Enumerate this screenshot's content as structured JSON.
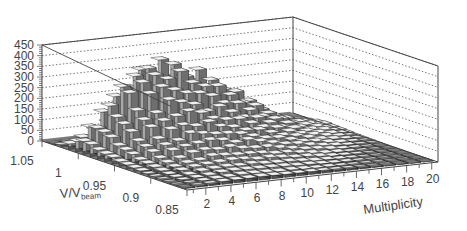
{
  "chart_data": {
    "type": "bar3d",
    "title": "",
    "xlabel": "Multiplicity",
    "ylabel": "V/V_beam",
    "ylabel_main": "V/V",
    "ylabel_sub": "beam",
    "zlabel": "",
    "x_range": [
      1,
      20
    ],
    "y_range": [
      0.85,
      1.05
    ],
    "z_range": [
      0,
      450
    ],
    "x_ticks": [
      2,
      4,
      6,
      8,
      10,
      12,
      14,
      16,
      18,
      20
    ],
    "y_ticks": [
      1.05,
      1,
      0.95,
      0.9,
      0.85
    ],
    "z_ticks": [
      0,
      50,
      100,
      150,
      200,
      250,
      300,
      350,
      400,
      450
    ],
    "grid": "dotted on back walls",
    "legend": "none",
    "series_peak_by_multiplicity": {
      "x": [
        1,
        2,
        3,
        4,
        5,
        6,
        7,
        8,
        9,
        10,
        11,
        12,
        13,
        14,
        15,
        16,
        17,
        18,
        19,
        20
      ],
      "peak_count": [
        60,
        120,
        200,
        290,
        350,
        400,
        390,
        380,
        330,
        320,
        280,
        240,
        200,
        160,
        120,
        90,
        60,
        40,
        25,
        15
      ]
    },
    "v_profile": {
      "v_bins": [
        1.05,
        1.04,
        1.03,
        1.02,
        1.01,
        1.0,
        0.99,
        0.98,
        0.97,
        0.96,
        0.95,
        0.94,
        0.93,
        0.92,
        0.91,
        0.9,
        0.89,
        0.88,
        0.87,
        0.86
      ],
      "relative_shape": [
        0.0,
        0.02,
        0.1,
        0.4,
        0.85,
        1.0,
        0.9,
        0.75,
        0.6,
        0.5,
        0.4,
        0.32,
        0.26,
        0.2,
        0.15,
        0.12,
        0.09,
        0.07,
        0.05,
        0.04
      ]
    }
  }
}
